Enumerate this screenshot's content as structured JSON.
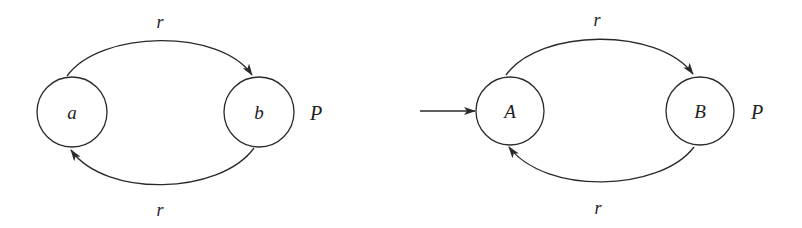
{
  "diagram": {
    "type": "state-transition-diagrams",
    "automata": [
      {
        "name": "P",
        "label": "P",
        "states": [
          {
            "id": "a",
            "label": "a",
            "initial": false
          },
          {
            "id": "b",
            "label": "b",
            "initial": false
          }
        ],
        "transitions": [
          {
            "from": "a",
            "to": "b",
            "label": "r",
            "position": "top"
          },
          {
            "from": "b",
            "to": "a",
            "label": "r",
            "position": "bottom"
          }
        ]
      },
      {
        "name": "P",
        "label": "P",
        "states": [
          {
            "id": "A",
            "label": "A",
            "initial": true
          },
          {
            "id": "B",
            "label": "B",
            "initial": false
          }
        ],
        "transitions": [
          {
            "from": "A",
            "to": "B",
            "label": "r",
            "position": "top"
          },
          {
            "from": "B",
            "to": "A",
            "label": "r",
            "position": "bottom"
          }
        ]
      }
    ],
    "colors": {
      "stroke": "#2a2a2a",
      "text": "#1e1e1e",
      "background": "#ffffff"
    }
  }
}
